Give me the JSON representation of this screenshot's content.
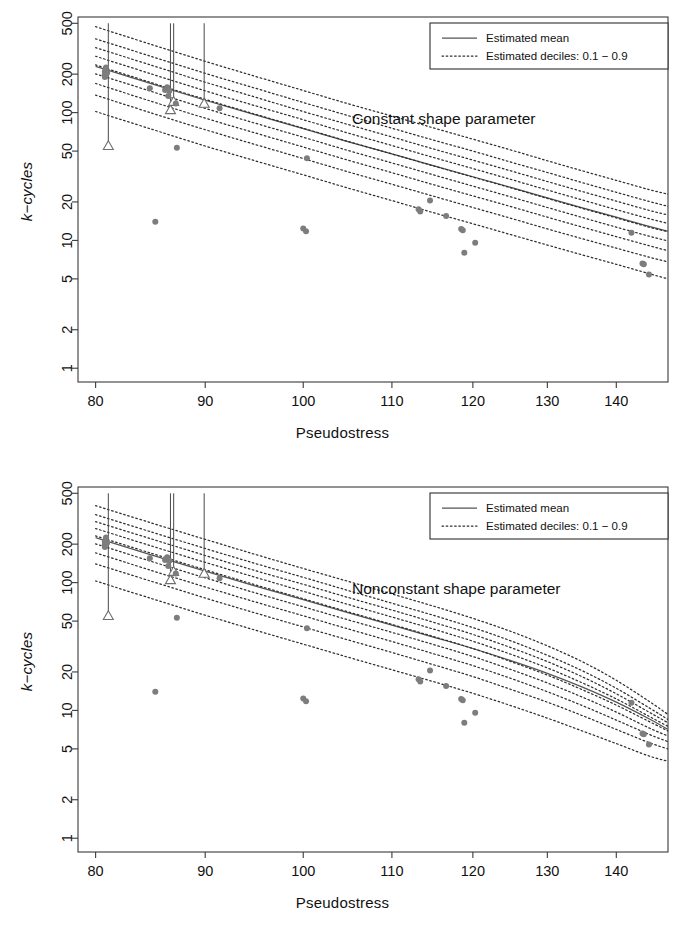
{
  "figure": {
    "panels": [
      {
        "id": "constant-shape",
        "caption": "Constant shape parameter",
        "legend": {
          "mean_label": "Estimated mean",
          "deciles_label": "Estimated deciles: 0.1 − 0.9"
        }
      },
      {
        "id": "nonconstant-shape",
        "caption": "Nonconstant shape parameter",
        "legend": {
          "mean_label": "Estimated mean",
          "deciles_label": "Estimated deciles: 0.1 − 0.9"
        }
      }
    ]
  },
  "axes": {
    "xlabel": "Pseudostress",
    "ylabel_prefix": "k",
    "ylabel_suffix": "−cycles",
    "ylabel": "k−cycles",
    "xticks": [
      80,
      90,
      100,
      110,
      120,
      130,
      140
    ],
    "xtick_labels": [
      "80",
      "90",
      "100",
      "110",
      "120",
      "130",
      "140"
    ],
    "yticks": [
      1,
      2,
      5,
      10,
      20,
      50,
      100,
      200,
      500
    ],
    "ytick_labels": [
      "1",
      "2",
      "5",
      "10",
      "20",
      "50",
      "100",
      "200",
      "500"
    ],
    "xlim": [
      78.5,
      148
    ],
    "ylim": [
      0.78,
      560
    ],
    "xscale": "log",
    "yscale": "log",
    "grid": false
  },
  "style": {
    "point_color": "#7d7d7d",
    "open_point_stroke": "#6f6f6f",
    "mean_curve_color": "#555555",
    "decile_curve_color": "#2e2e2e",
    "frame_color": "#3a3a3a",
    "background": "#ffffff"
  },
  "chart_data": [
    {
      "type": "line",
      "id": "constant-shape",
      "title": "Constant shape parameter",
      "xlabel": "Pseudostress",
      "ylabel": "k−cycles",
      "xscale": "log",
      "yscale": "log",
      "xlim": [
        78.5,
        148
      ],
      "ylim": [
        0.78,
        560
      ],
      "grid": false,
      "legend_position": "top-right",
      "legend_entries": [
        "Estimated mean",
        "Estimated deciles: 0.1 − 0.9"
      ],
      "x": [
        80,
        85,
        90,
        95,
        100,
        105,
        110,
        115,
        120,
        125,
        130,
        135,
        140,
        145,
        148
      ],
      "series": [
        {
          "name": "Estimated mean",
          "style": "solid",
          "values": [
            230,
            168,
            125,
            96,
            75,
            59,
            47.5,
            38.5,
            31.5,
            26.0,
            21.5,
            18.0,
            15.2,
            12.9,
            11.8
          ]
        },
        {
          "name": "decile 0.9",
          "style": "dotted",
          "quantile": 0.9,
          "values": [
            470,
            340,
            252,
            192,
            149,
            117,
            94,
            76,
            62.0,
            51.0,
            42.0,
            35.0,
            29.5,
            25.0,
            23.0
          ]
        },
        {
          "name": "decile 0.8",
          "style": "dotted",
          "quantile": 0.8,
          "values": [
            378,
            274,
            203,
            155,
            120,
            94.5,
            75.5,
            61.0,
            50.0,
            41.0,
            34.0,
            28.3,
            23.8,
            20.2,
            18.5
          ]
        },
        {
          "name": "decile 0.7",
          "style": "dotted",
          "quantile": 0.7,
          "values": [
            322,
            234,
            173,
            132,
            102,
            80.5,
            64.5,
            52.0,
            42.5,
            35.0,
            28.9,
            24.1,
            20.3,
            17.2,
            15.8
          ]
        },
        {
          "name": "decile 0.6",
          "style": "dotted",
          "quantile": 0.6,
          "values": [
            276,
            200,
            148,
            113,
            88,
            69.0,
            55.3,
            44.6,
            36.5,
            30.0,
            24.8,
            20.7,
            17.4,
            14.8,
            13.6
          ]
        },
        {
          "name": "decile 0.5",
          "style": "dotted",
          "quantile": 0.5,
          "values": [
            236,
            171,
            127,
            97,
            75.5,
            59.3,
            47.5,
            38.3,
            31.3,
            25.8,
            21.3,
            17.8,
            15.0,
            12.7,
            11.7
          ]
        },
        {
          "name": "decile 0.4",
          "style": "dotted",
          "quantile": 0.4,
          "values": [
            201,
            146,
            108,
            82.5,
            64.2,
            50.4,
            40.4,
            32.6,
            26.6,
            21.9,
            18.1,
            15.1,
            12.7,
            10.8,
            9.9
          ]
        },
        {
          "name": "decile 0.3",
          "style": "dotted",
          "quantile": 0.3,
          "values": [
            169,
            122,
            90.5,
            69.2,
            53.8,
            42.3,
            33.9,
            27.3,
            22.3,
            18.4,
            15.2,
            12.7,
            10.7,
            9.1,
            8.3
          ]
        },
        {
          "name": "decile 0.2",
          "style": "dotted",
          "quantile": 0.2,
          "values": [
            137,
            99.0,
            73.5,
            56.2,
            43.7,
            34.3,
            27.5,
            22.2,
            18.1,
            14.9,
            12.3,
            10.3,
            8.7,
            7.4,
            6.8
          ]
        },
        {
          "name": "decile 0.1",
          "style": "dotted",
          "quantile": 0.1,
          "values": [
            102,
            74.0,
            54.8,
            41.9,
            32.6,
            25.6,
            20.5,
            16.5,
            13.5,
            11.1,
            9.2,
            7.7,
            6.5,
            5.5,
            5.0
          ]
        }
      ],
      "points": [
        {
          "x": 80.8,
          "y": 210,
          "marker": "filled"
        },
        {
          "x": 80.8,
          "y": 200,
          "marker": "filled"
        },
        {
          "x": 80.8,
          "y": 190,
          "marker": "filled"
        },
        {
          "x": 80.9,
          "y": 225,
          "marker": "filled"
        },
        {
          "x": 81.0,
          "y": 205,
          "marker": "filled"
        },
        {
          "x": 81.1,
          "y": 55,
          "marker": "open-triangle"
        },
        {
          "x": 84.8,
          "y": 155,
          "marker": "filled"
        },
        {
          "x": 85.3,
          "y": 14,
          "marker": "filled"
        },
        {
          "x": 86.2,
          "y": 150,
          "marker": "filled"
        },
        {
          "x": 86.4,
          "y": 158,
          "marker": "filled"
        },
        {
          "x": 86.5,
          "y": 135,
          "marker": "filled"
        },
        {
          "x": 86.6,
          "y": 148,
          "marker": "filled"
        },
        {
          "x": 86.7,
          "y": 105,
          "marker": "open-triangle"
        },
        {
          "x": 87.0,
          "y": 122,
          "marker": "open-triangle"
        },
        {
          "x": 87.2,
          "y": 118,
          "marker": "filled"
        },
        {
          "x": 87.3,
          "y": 53,
          "marker": "filled"
        },
        {
          "x": 89.9,
          "y": 118,
          "marker": "open-triangle"
        },
        {
          "x": 91.4,
          "y": 108,
          "marker": "filled"
        },
        {
          "x": 100.0,
          "y": 12.4,
          "marker": "filled"
        },
        {
          "x": 100.3,
          "y": 11.8,
          "marker": "filled"
        },
        {
          "x": 100.4,
          "y": 44,
          "marker": "filled"
        },
        {
          "x": 113.2,
          "y": 17.5,
          "marker": "filled"
        },
        {
          "x": 113.4,
          "y": 16.8,
          "marker": "filled"
        },
        {
          "x": 114.6,
          "y": 20.5,
          "marker": "filled"
        },
        {
          "x": 116.6,
          "y": 15.5,
          "marker": "filled"
        },
        {
          "x": 118.5,
          "y": 12.3,
          "marker": "filled"
        },
        {
          "x": 118.7,
          "y": 12.0,
          "marker": "filled"
        },
        {
          "x": 118.9,
          "y": 8.0,
          "marker": "filled"
        },
        {
          "x": 120.3,
          "y": 9.6,
          "marker": "filled"
        },
        {
          "x": 142.3,
          "y": 11.5,
          "marker": "filled"
        },
        {
          "x": 144.0,
          "y": 6.6,
          "marker": "filled"
        },
        {
          "x": 144.2,
          "y": 6.5,
          "marker": "filled"
        },
        {
          "x": 145.0,
          "y": 5.4,
          "marker": "filled"
        }
      ],
      "censored_lines": [
        {
          "x": 81.1,
          "y_from": 500,
          "y_to": 55
        },
        {
          "x": 86.7,
          "y_from": 500,
          "y_to": 105
        },
        {
          "x": 87.0,
          "y_from": 500,
          "y_to": 122
        },
        {
          "x": 89.9,
          "y_from": 500,
          "y_to": 118
        }
      ]
    },
    {
      "type": "line",
      "id": "nonconstant-shape",
      "title": "Nonconstant shape parameter",
      "xlabel": "Pseudostress",
      "ylabel": "k−cycles",
      "xscale": "log",
      "yscale": "log",
      "xlim": [
        78.5,
        148
      ],
      "ylim": [
        0.78,
        560
      ],
      "grid": false,
      "legend_position": "top-right",
      "legend_entries": [
        "Estimated mean",
        "Estimated deciles: 0.1 − 0.9"
      ],
      "x": [
        80,
        85,
        90,
        95,
        100,
        105,
        110,
        115,
        120,
        125,
        130,
        135,
        140,
        145,
        148
      ],
      "series": [
        {
          "name": "Estimated mean",
          "style": "solid",
          "values": [
            225,
            164,
            123,
            94,
            73.5,
            58.0,
            46.5,
            37.5,
            30.5,
            24.5,
            19.5,
            15.2,
            11.6,
            8.6,
            7.1
          ]
        },
        {
          "name": "decile 0.9",
          "style": "dotted",
          "quantile": 0.9,
          "values": [
            400,
            292,
            218,
            166,
            129,
            102,
            81.5,
            65.5,
            52.5,
            41.5,
            32.0,
            24.0,
            17.2,
            11.8,
            9.3
          ]
        },
        {
          "name": "decile 0.8",
          "style": "dotted",
          "quantile": 0.8,
          "values": [
            340,
            248,
            185,
            141,
            110,
            86.5,
            69.0,
            55.5,
            44.5,
            35.0,
            27.0,
            20.4,
            14.9,
            10.5,
            8.5
          ]
        },
        {
          "name": "decile 0.7",
          "style": "dotted",
          "quantile": 0.7,
          "values": [
            300,
            219,
            163,
            124,
            97.0,
            76.3,
            61.0,
            49.0,
            39.3,
            31.0,
            24.1,
            18.3,
            13.5,
            9.7,
            8.0
          ]
        },
        {
          "name": "decile 0.6",
          "style": "dotted",
          "quantile": 0.6,
          "values": [
            265,
            193,
            144,
            110,
            85.5,
            67.3,
            53.8,
            43.3,
            34.8,
            27.5,
            21.5,
            16.4,
            12.3,
            9.0,
            7.5
          ]
        },
        {
          "name": "decile 0.5",
          "style": "dotted",
          "quantile": 0.5,
          "values": [
            232,
            169,
            126,
            96.0,
            74.8,
            58.9,
            47.1,
            37.9,
            30.5,
            24.1,
            18.9,
            14.5,
            11.0,
            8.2,
            6.9
          ]
        },
        {
          "name": "decile 0.4",
          "style": "dotted",
          "quantile": 0.4,
          "values": [
            201,
            146,
            109,
            83.0,
            64.7,
            51.0,
            40.8,
            32.8,
            26.4,
            20.9,
            16.4,
            12.7,
            9.7,
            7.3,
            6.3
          ]
        },
        {
          "name": "decile 0.3",
          "style": "dotted",
          "quantile": 0.3,
          "values": [
            171,
            124,
            92.5,
            70.5,
            55.0,
            43.3,
            34.6,
            27.8,
            22.4,
            17.8,
            14.0,
            10.9,
            8.4,
            6.5,
            5.7
          ]
        },
        {
          "name": "decile 0.2",
          "style": "dotted",
          "quantile": 0.2,
          "values": [
            140,
            102,
            75.8,
            57.8,
            45.0,
            35.5,
            28.4,
            22.8,
            18.4,
            14.6,
            11.6,
            9.1,
            7.1,
            5.6,
            5.0
          ]
        },
        {
          "name": "decile 0.1",
          "style": "dotted",
          "quantile": 0.1,
          "values": [
            103,
            74.8,
            55.6,
            42.4,
            33.0,
            26.0,
            20.8,
            16.8,
            13.6,
            10.9,
            8.7,
            6.9,
            5.5,
            4.4,
            4.0
          ]
        }
      ],
      "points": [
        {
          "x": 80.8,
          "y": 210,
          "marker": "filled"
        },
        {
          "x": 80.8,
          "y": 200,
          "marker": "filled"
        },
        {
          "x": 80.8,
          "y": 190,
          "marker": "filled"
        },
        {
          "x": 80.9,
          "y": 225,
          "marker": "filled"
        },
        {
          "x": 81.0,
          "y": 205,
          "marker": "filled"
        },
        {
          "x": 81.1,
          "y": 55,
          "marker": "open-triangle"
        },
        {
          "x": 84.8,
          "y": 155,
          "marker": "filled"
        },
        {
          "x": 85.3,
          "y": 14,
          "marker": "filled"
        },
        {
          "x": 86.2,
          "y": 150,
          "marker": "filled"
        },
        {
          "x": 86.4,
          "y": 158,
          "marker": "filled"
        },
        {
          "x": 86.5,
          "y": 135,
          "marker": "filled"
        },
        {
          "x": 86.6,
          "y": 148,
          "marker": "filled"
        },
        {
          "x": 86.7,
          "y": 105,
          "marker": "open-triangle"
        },
        {
          "x": 87.0,
          "y": 122,
          "marker": "open-triangle"
        },
        {
          "x": 87.2,
          "y": 118,
          "marker": "filled"
        },
        {
          "x": 87.3,
          "y": 53,
          "marker": "filled"
        },
        {
          "x": 89.9,
          "y": 118,
          "marker": "open-triangle"
        },
        {
          "x": 91.4,
          "y": 108,
          "marker": "filled"
        },
        {
          "x": 100.0,
          "y": 12.4,
          "marker": "filled"
        },
        {
          "x": 100.3,
          "y": 11.8,
          "marker": "filled"
        },
        {
          "x": 100.4,
          "y": 44,
          "marker": "filled"
        },
        {
          "x": 113.2,
          "y": 17.5,
          "marker": "filled"
        },
        {
          "x": 113.4,
          "y": 16.8,
          "marker": "filled"
        },
        {
          "x": 114.6,
          "y": 20.5,
          "marker": "filled"
        },
        {
          "x": 116.6,
          "y": 15.5,
          "marker": "filled"
        },
        {
          "x": 118.5,
          "y": 12.3,
          "marker": "filled"
        },
        {
          "x": 118.7,
          "y": 12.0,
          "marker": "filled"
        },
        {
          "x": 118.9,
          "y": 8.0,
          "marker": "filled"
        },
        {
          "x": 120.3,
          "y": 9.6,
          "marker": "filled"
        },
        {
          "x": 142.3,
          "y": 11.5,
          "marker": "filled"
        },
        {
          "x": 144.0,
          "y": 6.6,
          "marker": "filled"
        },
        {
          "x": 144.2,
          "y": 6.5,
          "marker": "filled"
        },
        {
          "x": 145.0,
          "y": 5.4,
          "marker": "filled"
        }
      ],
      "censored_lines": [
        {
          "x": 81.1,
          "y_from": 500,
          "y_to": 55
        },
        {
          "x": 86.7,
          "y_from": 500,
          "y_to": 105
        },
        {
          "x": 87.0,
          "y_from": 500,
          "y_to": 122
        },
        {
          "x": 89.9,
          "y_from": 500,
          "y_to": 118
        }
      ]
    }
  ]
}
